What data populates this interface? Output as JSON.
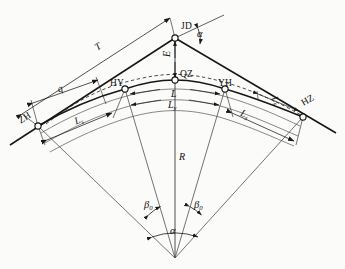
{
  "figure": {
    "type": "engineering-diagram",
    "domain": "surveying-route-geometry",
    "background_color": "#fbfbf9",
    "line_color": "#1a1a1a",
    "thin_line_color": "#4a4a4a"
  },
  "points": {
    "jd": {
      "label": "JD",
      "x": 175,
      "y": 38,
      "desc": "intersection-point"
    },
    "zh": {
      "label": "ZH",
      "x": 38,
      "y": 126,
      "desc": "tangent-to-spiral"
    },
    "hy": {
      "label": "HY",
      "x": 125,
      "y": 89,
      "desc": "spiral-to-curve"
    },
    "qz": {
      "label": "QZ",
      "x": 175,
      "y": 80,
      "desc": "mid-point-of-curve"
    },
    "yh": {
      "label": "YH",
      "x": 225,
      "y": 89,
      "desc": "curve-to-spiral"
    },
    "hz": {
      "label": "HZ",
      "x": 303,
      "y": 117,
      "desc": "spiral-to-tangent"
    }
  },
  "dimensions": {
    "tangent": "T",
    "external": "E",
    "shift": "q",
    "curve_total": "L",
    "circular_curve": "L",
    "circular_curve_sub": "y",
    "spiral_left": "L",
    "spiral_left_sub": "s",
    "spiral_right": "L",
    "spiral_right_sub": "s",
    "spiral_far_right": "L",
    "spiral_far_right_sub": "s",
    "radius": "R"
  },
  "angles": {
    "alpha_apex": "α",
    "alpha_center": "α",
    "beta_left": "β",
    "beta_left_sub": "0",
    "beta_right": "β",
    "beta_right_sub": "0"
  },
  "center": {
    "x": 175,
    "y": 258,
    "desc": "circle-center"
  }
}
